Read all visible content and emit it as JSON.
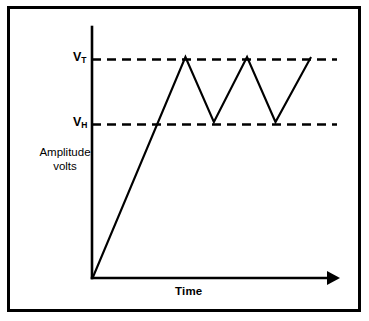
{
  "figure": {
    "background_color": "#ffffff",
    "ink_color": "#000000",
    "border_color": "#000000"
  },
  "labels": {
    "y_threshold_upper_base": "V",
    "y_threshold_upper_sub": "T",
    "y_threshold_lower_base": "V",
    "y_threshold_lower_sub": "H",
    "y_axis_line1": "Amplitude",
    "y_axis_line2": "volts",
    "x_axis": "Time"
  },
  "chart_data": {
    "type": "line",
    "title": "",
    "subtitle": "",
    "xlabel": "Time",
    "ylabel": "Amplitude volts",
    "grid": false,
    "legend": null,
    "axis_arrow_x": true,
    "xlim": [
      0,
      100
    ],
    "ylim": [
      0,
      100
    ],
    "x_tick_labels": [],
    "y_tick_labels": [
      "V_H",
      "V_T"
    ],
    "annotations": [
      {
        "text": "V_T",
        "y": 88,
        "role": "upper-threshold-label"
      },
      {
        "text": "V_H",
        "y": 62,
        "role": "lower-threshold-label"
      }
    ],
    "reference_lines": [
      {
        "name": "V_T",
        "label": "V_T",
        "orientation": "horizontal",
        "y": 88,
        "style": "dashed",
        "x_from": 0,
        "x_to": 100
      },
      {
        "name": "V_H",
        "label": "V_H",
        "orientation": "horizontal",
        "y": 62,
        "style": "dashed",
        "x_from": 0,
        "x_to": 100
      }
    ],
    "series": [
      {
        "name": "Capacitor charge waveform",
        "style": "solid",
        "points": [
          {
            "x": 0,
            "y": 0
          },
          {
            "x": 39,
            "y": 88
          },
          {
            "x": 51,
            "y": 62
          },
          {
            "x": 65,
            "y": 88
          },
          {
            "x": 77,
            "y": 62
          },
          {
            "x": 92,
            "y": 88
          }
        ]
      }
    ]
  }
}
